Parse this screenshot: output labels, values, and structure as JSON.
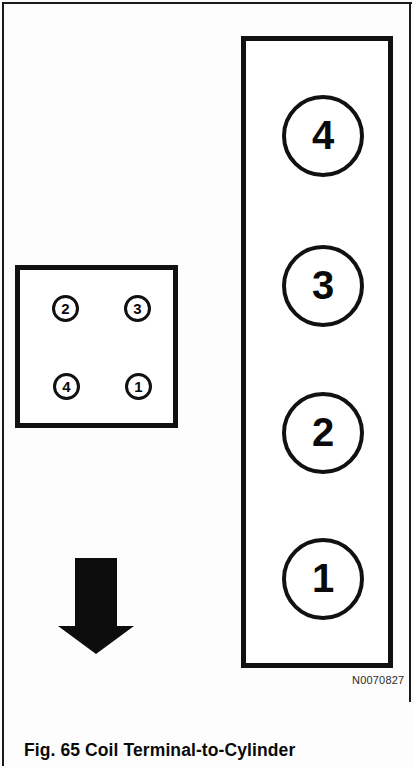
{
  "figure": {
    "caption": "Fig. 65  Coil Terminal-to-Cylinder",
    "reference_code": "N0070827",
    "background_color": "#fdfdfd",
    "line_color": "#111111"
  },
  "coil_pack": {
    "name": "ignition-coil-pack",
    "shape": "tall-rectangle",
    "terminals": [
      {
        "label": "4",
        "position": "top"
      },
      {
        "label": "3",
        "position": "upper-middle"
      },
      {
        "label": "2",
        "position": "lower-middle"
      },
      {
        "label": "1",
        "position": "bottom"
      }
    ]
  },
  "cylinder_block": {
    "name": "cylinder-block",
    "shape": "square",
    "ports": [
      {
        "label": "2",
        "position": "top-left"
      },
      {
        "label": "3",
        "position": "top-right"
      },
      {
        "label": "4",
        "position": "bottom-left"
      },
      {
        "label": "1",
        "position": "bottom-right"
      }
    ]
  },
  "direction_arrow": {
    "name": "direction-arrow",
    "direction": "down",
    "fill_color": "#0d0d0d"
  }
}
